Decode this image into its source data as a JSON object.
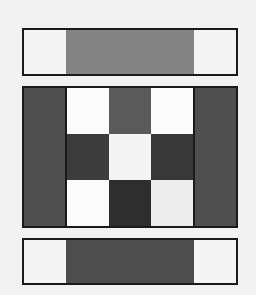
{
  "figure": {
    "background_color": "#f2f2f2",
    "border_color": "#1a1a1a",
    "width": 256,
    "height": 295
  },
  "palette": {
    "near_white": "#fbfbfb",
    "off_white": "#f4f4f4",
    "light_gray": "#ededed",
    "mid_gray": "#838383",
    "gray": "#5a5a5a",
    "dark_gray": "#4d4d4d",
    "darker_gray": "#3c3c3c",
    "darkest_gray": "#2e2e2e",
    "outline": "#1a1a1a"
  },
  "top_bar": {
    "name": "top-bar",
    "cells": [
      {
        "label": "top-left",
        "color": "#f4f4f4",
        "width_pct": 20
      },
      {
        "label": "top-center",
        "color": "#838383",
        "width_pct": 60
      },
      {
        "label": "top-right",
        "color": "#f4f4f4",
        "width_pct": 20
      }
    ]
  },
  "bottom_bar": {
    "name": "bottom-bar",
    "cells": [
      {
        "label": "bottom-left",
        "color": "#f4f4f4",
        "width_pct": 20
      },
      {
        "label": "bottom-center",
        "color": "#4d4d4d",
        "width_pct": 60
      },
      {
        "label": "bottom-right",
        "color": "#f4f4f4",
        "width_pct": 20
      }
    ]
  },
  "main_grid": {
    "name": "main-grid",
    "columns": 5,
    "rows": 3,
    "cells": [
      {
        "r": 0,
        "c": 0,
        "color": "#4f4f4f"
      },
      {
        "r": 0,
        "c": 1,
        "color": "#fbfbfb"
      },
      {
        "r": 0,
        "c": 2,
        "color": "#5a5a5a"
      },
      {
        "r": 0,
        "c": 3,
        "color": "#fbfbfb"
      },
      {
        "r": 0,
        "c": 4,
        "color": "#4f4f4f"
      },
      {
        "r": 1,
        "c": 0,
        "color": "#4f4f4f"
      },
      {
        "r": 1,
        "c": 1,
        "color": "#3c3c3c"
      },
      {
        "r": 1,
        "c": 2,
        "color": "#f4f4f4"
      },
      {
        "r": 1,
        "c": 3,
        "color": "#383838"
      },
      {
        "r": 1,
        "c": 4,
        "color": "#4f4f4f"
      },
      {
        "r": 2,
        "c": 0,
        "color": "#4f4f4f"
      },
      {
        "r": 2,
        "c": 1,
        "color": "#fbfbfb"
      },
      {
        "r": 2,
        "c": 2,
        "color": "#2e2e2e"
      },
      {
        "r": 2,
        "c": 3,
        "color": "#ededed"
      },
      {
        "r": 2,
        "c": 4,
        "color": "#4f4f4f"
      }
    ]
  },
  "chart_data": {
    "type": "heatmap",
    "xlabel": "",
    "ylabel": "",
    "grid": true,
    "legend": "none",
    "panels": [
      {
        "name": "top-bar",
        "rows": 1,
        "columns": 3,
        "values": [
          [
            0.957,
            0.514,
            0.957
          ]
        ],
        "colors": [
          [
            "#f4f4f4",
            "#838383",
            "#f4f4f4"
          ]
        ]
      },
      {
        "name": "main-grid",
        "rows": 3,
        "columns": 5,
        "values": [
          [
            0.31,
            0.984,
            0.353,
            0.984,
            0.31
          ],
          [
            0.31,
            0.235,
            0.957,
            0.22,
            0.31
          ],
          [
            0.31,
            0.984,
            0.18,
            0.929,
            0.31
          ]
        ],
        "colors": [
          [
            "#4f4f4f",
            "#fbfbfb",
            "#5a5a5a",
            "#fbfbfb",
            "#4f4f4f"
          ],
          [
            "#4f4f4f",
            "#3c3c3c",
            "#f4f4f4",
            "#383838",
            "#4f4f4f"
          ],
          [
            "#4f4f4f",
            "#fbfbfb",
            "#2e2e2e",
            "#ededed",
            "#4f4f4f"
          ]
        ]
      },
      {
        "name": "bottom-bar",
        "rows": 1,
        "columns": 3,
        "values": [
          [
            0.957,
            0.302,
            0.957
          ]
        ],
        "colors": [
          [
            "#f4f4f4",
            "#4d4d4d",
            "#f4f4f4"
          ]
        ]
      }
    ],
    "colormap": "gray",
    "vmin": 0.0,
    "vmax": 1.0
  }
}
